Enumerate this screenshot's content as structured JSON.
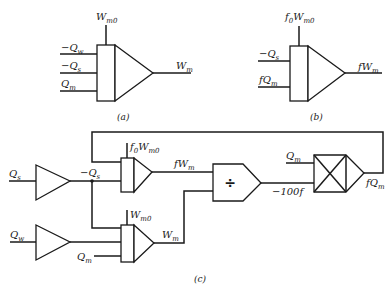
{
  "diagram": {
    "panels": [
      {
        "caption": "(a)",
        "block": "summing-integrator",
        "top_input": {
          "main": "W",
          "sub": "m0"
        },
        "inputs": [
          {
            "sign": "−",
            "main": "Q",
            "sub": "w"
          },
          {
            "sign": "−",
            "main": "Q",
            "sub": "s"
          },
          {
            "sign": "",
            "main": "Q",
            "sub": "m"
          }
        ],
        "output": {
          "main": "W",
          "sub": "m"
        }
      },
      {
        "caption": "(b)",
        "block": "summing-integrator",
        "top_input": {
          "prefix": "f",
          "prefix_sub": "0",
          "main": "W",
          "sub": "m0"
        },
        "inputs": [
          {
            "sign": "−",
            "main": "Q",
            "sub": "s"
          },
          {
            "prefix": "f",
            "main": "Q",
            "sub": "m"
          }
        ],
        "output": {
          "prefix": "f",
          "main": "W",
          "sub": "m"
        }
      },
      {
        "caption": "(c)",
        "blocks": [
          "inverter-Qs",
          "inverter-Qw",
          "integrator-fWm",
          "integrator-Wm",
          "divider",
          "multiplier"
        ],
        "labels": {
          "qs_in": {
            "main": "Q",
            "sub": "s"
          },
          "qw_in": {
            "main": "Q",
            "sub": "w"
          },
          "neg_qs": {
            "sign": "−",
            "main": "Q",
            "sub": "s"
          },
          "f0wm0": {
            "prefix": "f",
            "prefix_sub": "0",
            "main": "W",
            "sub": "m0"
          },
          "wm0": {
            "main": "W",
            "sub": "m0"
          },
          "qm_lower": {
            "main": "Q",
            "sub": "m"
          },
          "fwm": {
            "prefix": "f",
            "main": "W",
            "sub": "m"
          },
          "wm": {
            "main": "W",
            "sub": "m"
          },
          "divide_symbol": "÷",
          "neg100f": "−100f",
          "qm_mult": {
            "main": "Q",
            "sub": "m"
          },
          "fqm": {
            "prefix": "f",
            "main": "Q",
            "sub": "m"
          }
        }
      }
    ]
  }
}
